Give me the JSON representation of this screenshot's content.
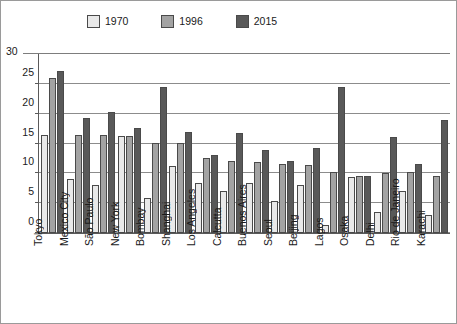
{
  "chart_data": {
    "type": "bar",
    "title": "",
    "subtitle": "",
    "xlabel": "",
    "ylabel": "",
    "ylim": [
      0,
      30
    ],
    "ytick_values": [
      0,
      5,
      10,
      15,
      20,
      25,
      30
    ],
    "ytick_labels": [
      "0",
      "5",
      "10",
      "15",
      "20",
      "25",
      "30"
    ],
    "grid": true,
    "legend_position": "top",
    "categories": [
      "Tokyo",
      "Mexico City",
      "São Paulo",
      "New York",
      "Bombay",
      "Shanghai",
      "Los Angeles",
      "Calcutta",
      "Buenos Aires",
      "Seoul",
      "Beijing",
      "Lagos",
      "Osaka",
      "Delhi",
      "Rio de Janeiro",
      "Karachi"
    ],
    "series": [
      {
        "name": "1970",
        "color": "#e9e9e9",
        "values": [
          16.5,
          9.1,
          8.1,
          16.2,
          5.9,
          11.2,
          8.4,
          7.1,
          8.4,
          5.4,
          8.1,
          1.4,
          9.4,
          3.5,
          7.0,
          3.1
        ]
      },
      {
        "name": "1996",
        "color": "#a3a3a3",
        "values": [
          26.0,
          16.5,
          16.4,
          16.3,
          15.1,
          15.1,
          12.6,
          12.1,
          11.9,
          11.6,
          11.4,
          10.3,
          9.6,
          10.0,
          10.2,
          9.6
        ]
      },
      {
        "name": "2015",
        "color": "#595959",
        "values": [
          27.2,
          19.2,
          20.3,
          17.6,
          24.4,
          17.0,
          13.1,
          16.7,
          13.9,
          12.0,
          14.2,
          24.4,
          9.5,
          16.1,
          11.5,
          19.0
        ]
      }
    ],
    "legend": [
      {
        "label": "1970",
        "color": "#e9e9e9"
      },
      {
        "label": "1996",
        "color": "#a3a3a3"
      },
      {
        "label": "2015",
        "color": "#595959"
      }
    ],
    "axis_colors": {
      "gridline": "#8c8c8c",
      "axis": "#5a5a5a",
      "bar_border": "#4a4a4a",
      "text": "#1a1a1a",
      "frame": "#9a9a9a"
    }
  }
}
